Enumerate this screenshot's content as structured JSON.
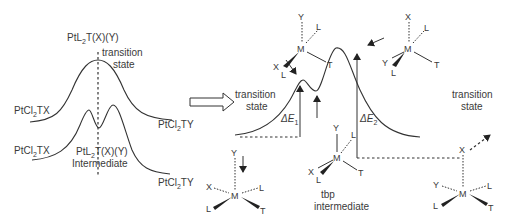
{
  "left_panel": {
    "top_profile": {
      "center_label": "PtL2T(X)(Y)",
      "center_label_base": "PtL",
      "center_label_sub": "2",
      "center_label_rest": "T(X)(Y)",
      "state_label_line1": "transition",
      "state_label_line2": "state",
      "left_species_base": "PtCl",
      "left_species_sub": "2",
      "left_species_rest": "TX",
      "right_species_base": "PtCl",
      "right_species_sub": "2",
      "right_species_rest": "TY"
    },
    "bottom_profile": {
      "center_label_base": "PtL",
      "center_label_sub": "2",
      "center_label_rest": "T(X)(Y)",
      "center_label_line2": "Intermediate",
      "left_species_base": "PtCl",
      "left_species_sub": "2",
      "left_species_rest": "TX",
      "right_species_base": "PtCl",
      "right_species_sub": "2",
      "right_species_rest": "TY"
    }
  },
  "right_panel": {
    "left_ts_label_line1": "transition",
    "left_ts_label_line2": "state",
    "right_ts_label_line1": "transition",
    "right_ts_label_line2": "state",
    "delta_e1": "ΔE",
    "delta_e1_sub": "1",
    "delta_e2": "ΔE",
    "delta_e2_sub": "2",
    "intermediate_line1": "tbp",
    "intermediate_line2": "intermediate",
    "structures": {
      "ts_left": {
        "apical": "Y",
        "center": "M",
        "ligands": [
          "L",
          "X",
          "L",
          "T"
        ]
      },
      "ts_right": {
        "apical": "X",
        "center": "M",
        "ligands": [
          "L",
          "Y",
          "L",
          "T"
        ]
      },
      "tbp": {
        "apical": "Y",
        "center": "M",
        "ligands": [
          "L",
          "X",
          "L",
          "T"
        ]
      },
      "reactant": {
        "apical": "Y",
        "center": "M",
        "ligands": [
          "X",
          "L",
          "L",
          "T"
        ]
      },
      "product": {
        "apical": "X",
        "center": "M",
        "ligands": [
          "Y",
          "L",
          "L",
          "T"
        ]
      }
    }
  }
}
